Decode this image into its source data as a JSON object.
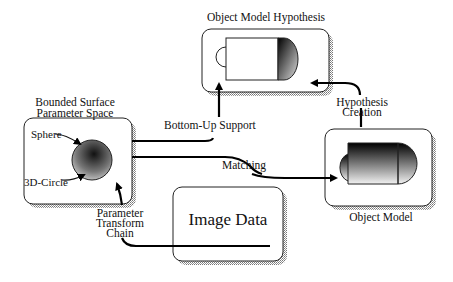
{
  "diagram": {
    "nodes": {
      "hypothesis": {
        "title": "Object Model Hypothesis"
      },
      "param_space": {
        "title_line1": "Bounded Surface",
        "title_line2": "Parameter Space",
        "inner_labels": {
          "sphere": "Sphere",
          "circle": "3D-Circle"
        }
      },
      "object_model": {
        "title": "Object Model"
      },
      "image_data": {
        "title": "Image Data"
      }
    },
    "edges": {
      "bottom_up": "Bottom-Up Support",
      "matching": "Matching",
      "hyp_creation_line1": "Hypothesis",
      "hyp_creation_line2": "Creation",
      "param_line1": "Parameter",
      "param_line2": "Transform",
      "param_line3": "Chain"
    }
  }
}
